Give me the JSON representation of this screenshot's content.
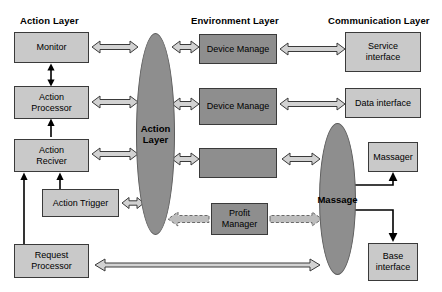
{
  "diagram": {
    "colors": {
      "light_box": "#c9c9c9",
      "dark_box": "#8e8e8e",
      "oval": "#8e8e8e",
      "arrow_hollow": "#d2d2d2",
      "arrow_stroke": "#3a3a3a",
      "text": "#000000",
      "background": "#ffffff"
    },
    "layer_titles": [
      {
        "id": "action",
        "label": "Action Layer",
        "x": 20,
        "y": 16
      },
      {
        "id": "environment",
        "label": "Environment Layer",
        "x": 191,
        "y": 16
      },
      {
        "id": "communication",
        "label": "Communication Layer",
        "x": 328,
        "y": 16
      }
    ],
    "nodes": [
      {
        "id": "monitor",
        "label": "Monitor",
        "shade": "light",
        "x": 14,
        "y": 32,
        "w": 75,
        "h": 31
      },
      {
        "id": "action-processor",
        "label": "Action\nProcessor",
        "shade": "light",
        "x": 14,
        "y": 86,
        "w": 75,
        "h": 33
      },
      {
        "id": "action-reciver",
        "label": "Action\nReciver",
        "shade": "light",
        "x": 14,
        "y": 139,
        "w": 75,
        "h": 33
      },
      {
        "id": "action-trigger",
        "label": "Action Trigger",
        "shade": "light",
        "x": 42,
        "y": 189,
        "w": 77,
        "h": 28
      },
      {
        "id": "request-processor",
        "label": "Request\nProcessor",
        "shade": "light",
        "x": 14,
        "y": 244,
        "w": 75,
        "h": 34
      },
      {
        "id": "device-manage-1",
        "label": "Device Manage",
        "shade": "dark",
        "x": 199,
        "y": 34,
        "w": 78,
        "h": 30
      },
      {
        "id": "device-manage-2",
        "label": "Device Manage",
        "shade": "dark",
        "x": 199,
        "y": 88,
        "w": 78,
        "h": 37
      },
      {
        "id": "device-manage-3",
        "label": "",
        "shade": "dark",
        "x": 199,
        "y": 148,
        "w": 78,
        "h": 30
      },
      {
        "id": "profit-manager",
        "label": "Profit\nManager",
        "shade": "dark",
        "x": 211,
        "y": 203,
        "w": 57,
        "h": 32
      },
      {
        "id": "service-interface",
        "label": "Service\ninterface",
        "shade": "light",
        "x": 345,
        "y": 32,
        "w": 76,
        "h": 40
      },
      {
        "id": "data-interface",
        "label": "Data interface",
        "shade": "light",
        "x": 345,
        "y": 88,
        "w": 76,
        "h": 30
      },
      {
        "id": "massager",
        "label": "Massager",
        "shade": "light",
        "x": 368,
        "y": 142,
        "w": 50,
        "h": 30
      },
      {
        "id": "base-interface",
        "label": "Base\ninterface",
        "shade": "light",
        "x": 368,
        "y": 243,
        "w": 50,
        "h": 38
      }
    ],
    "ovals": [
      {
        "id": "action-layer-oval",
        "label": "Action\nLayer",
        "x": 136,
        "y": 33,
        "w": 39,
        "h": 202
      },
      {
        "id": "massage-oval",
        "label": "Massage",
        "x": 319,
        "y": 123,
        "w": 37,
        "h": 152
      }
    ],
    "connectors": [
      {
        "id": "monitor-to-action-oval",
        "style": "hollow-double"
      },
      {
        "id": "action-processor-to-oval",
        "style": "hollow-double"
      },
      {
        "id": "action-reciver-to-oval",
        "style": "hollow-double"
      },
      {
        "id": "action-trigger-to-oval",
        "style": "hollow-double"
      },
      {
        "id": "oval-to-device-manage-1",
        "style": "hollow-double"
      },
      {
        "id": "oval-to-device-manage-2",
        "style": "hollow-double"
      },
      {
        "id": "oval-to-device-manage-3",
        "style": "hollow-double"
      },
      {
        "id": "device-manage-1-to-service",
        "style": "hollow-double"
      },
      {
        "id": "device-manage-2-to-data",
        "style": "hollow-double"
      },
      {
        "id": "device-manage-3-to-massage",
        "style": "hollow-double"
      },
      {
        "id": "profit-manager-to-massage",
        "style": "hollow-dashed-right"
      },
      {
        "id": "oval-to-profit-manager",
        "style": "hollow-dashed-left"
      },
      {
        "id": "request-processor-to-massage",
        "style": "hollow-double-long"
      },
      {
        "id": "monitor-action-processor",
        "style": "solid-double-vertical"
      },
      {
        "id": "action-processor-action-reciver",
        "style": "solid-up-vertical"
      },
      {
        "id": "action-trigger-to-reciver",
        "style": "solid-up-vertical"
      },
      {
        "id": "request-processor-to-reciver",
        "style": "solid-up-vertical"
      },
      {
        "id": "massage-to-massager",
        "style": "solid-elbow-double"
      },
      {
        "id": "massage-to-base-interface",
        "style": "solid-elbow-double"
      }
    ]
  }
}
